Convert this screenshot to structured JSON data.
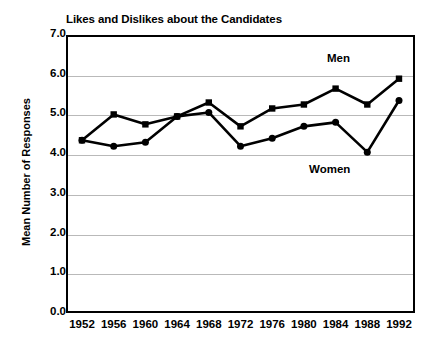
{
  "chart_data": {
    "type": "line",
    "title": "Likes and Dislikes about the Candidates",
    "xlabel": "",
    "ylabel": "Mean Number of Responses",
    "categories": [
      "1952",
      "1956",
      "1960",
      "1964",
      "1968",
      "1972",
      "1976",
      "1980",
      "1984",
      "1988",
      "1992"
    ],
    "x": [
      1952,
      1956,
      1960,
      1964,
      1968,
      1972,
      1976,
      1980,
      1984,
      1988,
      1992
    ],
    "ylim": [
      0.0,
      7.0
    ],
    "ytick_labels": [
      "0.0",
      "1.0",
      "2.0",
      "3.0",
      "4.0",
      "5.0",
      "6.0",
      "7.0"
    ],
    "ytick_values": [
      0.0,
      1.0,
      2.0,
      3.0,
      4.0,
      5.0,
      6.0,
      7.0
    ],
    "grid": "horizontal",
    "legend_position": "inline-annotations",
    "series": [
      {
        "name": "Men",
        "marker": "square",
        "values": [
          4.35,
          5.0,
          4.75,
          4.95,
          5.3,
          4.7,
          5.15,
          5.25,
          5.65,
          5.25,
          5.9
        ]
      },
      {
        "name": "Women",
        "marker": "circle",
        "values": [
          4.35,
          4.2,
          4.3,
          4.95,
          5.05,
          4.2,
          4.4,
          4.7,
          4.8,
          4.05,
          5.35
        ]
      }
    ],
    "annotations": [
      {
        "text": "Men",
        "x": 1984,
        "y": 6.35
      },
      {
        "text": "Women",
        "x": 1982,
        "y": 3.55
      }
    ],
    "colors": {
      "line": "#000000",
      "marker": "#000000",
      "grid": "#b9b9b9",
      "axis": "#000000",
      "background": "#ffffff"
    }
  }
}
